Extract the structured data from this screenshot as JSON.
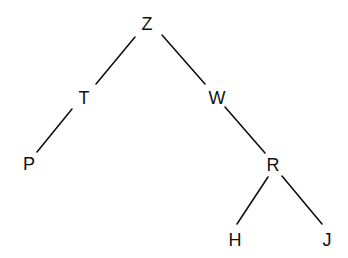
{
  "diagram": {
    "type": "tree",
    "root": "Z",
    "nodes": [
      {
        "id": "Z",
        "label": "Z",
        "x": 147,
        "y": 24
      },
      {
        "id": "T",
        "label": "T",
        "x": 84,
        "y": 98
      },
      {
        "id": "W",
        "label": "W",
        "x": 217,
        "y": 98
      },
      {
        "id": "P",
        "label": "P",
        "x": 29,
        "y": 164
      },
      {
        "id": "R",
        "label": "R",
        "x": 273,
        "y": 165
      },
      {
        "id": "H",
        "label": "H",
        "x": 235,
        "y": 240
      },
      {
        "id": "J",
        "label": "J",
        "x": 327,
        "y": 240
      }
    ],
    "edges": [
      {
        "from": "Z",
        "to": "T",
        "x1": 135,
        "y1": 37,
        "x2": 96,
        "y2": 84
      },
      {
        "from": "Z",
        "to": "W",
        "x1": 162,
        "y1": 35,
        "x2": 205,
        "y2": 84
      },
      {
        "from": "T",
        "to": "P",
        "x1": 72,
        "y1": 109,
        "x2": 37,
        "y2": 152
      },
      {
        "from": "W",
        "to": "R",
        "x1": 225,
        "y1": 107,
        "x2": 265,
        "y2": 153
      },
      {
        "from": "R",
        "to": "H",
        "x1": 268,
        "y1": 177,
        "x2": 237,
        "y2": 224
      },
      {
        "from": "R",
        "to": "J",
        "x1": 282,
        "y1": 176,
        "x2": 322,
        "y2": 224
      }
    ]
  }
}
